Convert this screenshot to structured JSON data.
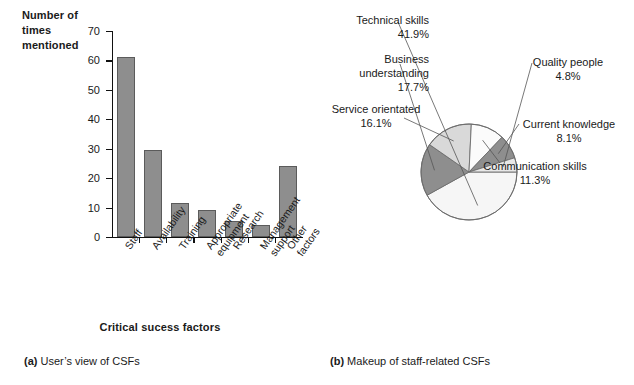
{
  "figure": {
    "caption_a_key": "(a)",
    "caption_a_text": " User’s view of CSFs",
    "caption_b_key": "(b)",
    "caption_b_text": " Makeup of staff-related CSFs"
  },
  "colors": {
    "bar_fill": "#8e8e8e",
    "bar_stroke": "#5b5b5b",
    "axis": "#111111",
    "pie_dark": "#8e8e8e",
    "pie_mid": "#d3d3d3",
    "pie_light": "#f2f2f2",
    "pie_stroke": "#6d6d6d",
    "text": "#1a1a1a"
  },
  "chart_data": [
    {
      "type": "bar",
      "title": "",
      "xlabel": "Critical sucess factors",
      "ylabel": "Number of times mentioned",
      "ylim": [
        0,
        70
      ],
      "yticks": [
        0,
        10,
        20,
        30,
        40,
        50,
        60,
        70
      ],
      "grid": false,
      "legend": "none",
      "categories": [
        "Staff",
        "Availability",
        "Training",
        "Appropriate\nequipment",
        "Research",
        "Management\nsupport",
        "Other\nfactors"
      ],
      "values": [
        61,
        29.5,
        11.5,
        9.3,
        5.5,
        4.2,
        24
      ]
    },
    {
      "type": "pie",
      "title": "",
      "legend": "leader-lines",
      "labels": [
        "Technical skills",
        "Business understanding",
        "Service orientated",
        "Communication skills",
        "Current knowledge",
        "Quality people"
      ],
      "values": [
        41.9,
        17.7,
        16.1,
        11.3,
        8.1,
        4.8
      ],
      "value_labels": [
        "41.9%",
        "17.7%",
        "16.1%",
        "11.3%",
        "8.1%",
        "4.8%"
      ],
      "slices": [
        {
          "name": "technical-skills",
          "label": "Technical skills",
          "value": 41.9,
          "value_label": "41.9%",
          "shade": "#f6f6f6"
        },
        {
          "name": "business-understanding",
          "label": "Business understanding",
          "value": 17.7,
          "value_label": "17.7%",
          "shade": "#8e8e8e"
        },
        {
          "name": "service-orientated",
          "label": "Service orientated",
          "value": 16.1,
          "value_label": "16.1%",
          "shade": "#d9d9d9"
        },
        {
          "name": "communication-skills",
          "label": "Communication skills",
          "value": 11.3,
          "value_label": "11.3%",
          "shade": "#fbfbfb"
        },
        {
          "name": "current-knowledge",
          "label": "Current knowledge",
          "value": 8.1,
          "value_label": "8.1%",
          "shade": "#8e8e8e"
        },
        {
          "name": "quality-people",
          "label": "Quality people",
          "value": 4.8,
          "value_label": "4.8%",
          "shade": "#e8e8e8"
        }
      ]
    }
  ],
  "bar_chart": {
    "ylabel_line1": "Number of",
    "ylabel_line2": "times",
    "ylabel_line3": "mentioned",
    "xaxis_title": "Critical sucess factors",
    "yticks": [
      "70",
      "60",
      "50",
      "40",
      "30",
      "20",
      "10",
      "0"
    ],
    "cats": [
      "Staff",
      "Availability",
      "Training",
      "Appropriate\nequipment",
      "Research",
      "Management\nsupport",
      "Other\nfactors"
    ]
  },
  "pie_chart": {
    "labels": {
      "technical_skills": "Technical skills\n41.9%",
      "business_understanding": "Business\nunderstanding\n17.7%",
      "service_orientated": "Service orientated\n16.1%",
      "quality_people": "Quality people\n4.8%",
      "current_knowledge": "Current knowledge\n8.1%",
      "communication_skills": "Communication skills\n11.3%"
    }
  }
}
